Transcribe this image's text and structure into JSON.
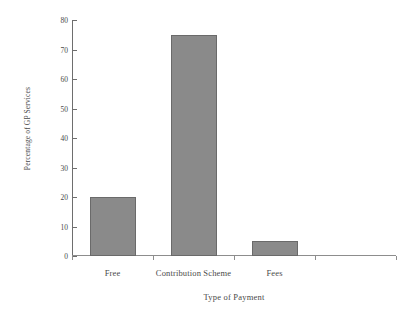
{
  "chart_data": {
    "type": "bar",
    "title": "",
    "xlabel": "Type of Payment",
    "ylabel": "Percentage of GP Services",
    "categories": [
      "Free",
      "Contribution Scheme",
      "Fees"
    ],
    "values": [
      20,
      75,
      5
    ],
    "ylim": [
      0,
      80
    ],
    "yticks": [
      0,
      10,
      20,
      30,
      40,
      50,
      60,
      70,
      80
    ],
    "ytick_labels": [
      "0",
      "10",
      "20",
      "30",
      "40",
      "50",
      "60",
      "70",
      "80"
    ],
    "grid": false,
    "legend": false,
    "legend_position": "none",
    "bar_color": "#8a8a8a",
    "bar_edge_color": "#6a6a6a",
    "axis_color": "#6e6e6e",
    "text_color": "#4a4a4a",
    "background_color": "#ffffff"
  }
}
